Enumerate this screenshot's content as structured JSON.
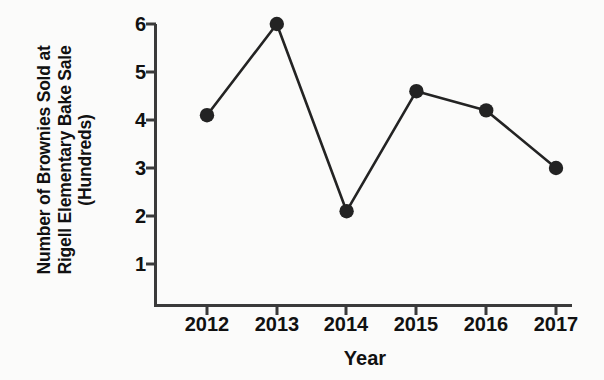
{
  "chart_data": {
    "type": "line",
    "title": "",
    "categories": [
      "2012",
      "2013",
      "2014",
      "2015",
      "2016",
      "2017"
    ],
    "x": [
      2012,
      2013,
      2014,
      2015,
      2016,
      2017
    ],
    "values": [
      4.1,
      6.0,
      2.1,
      4.6,
      4.2,
      3.0
    ],
    "series": [
      {
        "name": "Brownies Sold",
        "values": [
          4.1,
          6.0,
          2.1,
          4.6,
          4.2,
          3.0
        ]
      }
    ],
    "xlabel": "Year",
    "ylabel": "Number of Brownies Sold at Rigell Elementary Bake Sale (Hundreds)",
    "ylabel_lines": [
      "Number of Brownies Sold at",
      "Rigell Elementary Bake Sale",
      "(Hundreds)"
    ],
    "ytick_labels": [
      "6",
      "5",
      "4",
      "3",
      "2",
      "1"
    ],
    "ytick_values": [
      6,
      5,
      4,
      3,
      2,
      1
    ],
    "xtick_labels": [
      "2012",
      "2013",
      "2014",
      "2015",
      "2016",
      "2017"
    ],
    "ylim": [
      0.15,
      6.35
    ],
    "xlim": [
      2011.55,
      2017.45
    ],
    "grid": false,
    "legend": false,
    "legend_position": "none",
    "marker": "filled-circle",
    "colors": {
      "line": "#232323",
      "marker": "#232323",
      "axis": "#3a3a3a",
      "text": "#111111",
      "background": "#fbfbfa"
    }
  },
  "axis_titles": {
    "x": "Year"
  }
}
